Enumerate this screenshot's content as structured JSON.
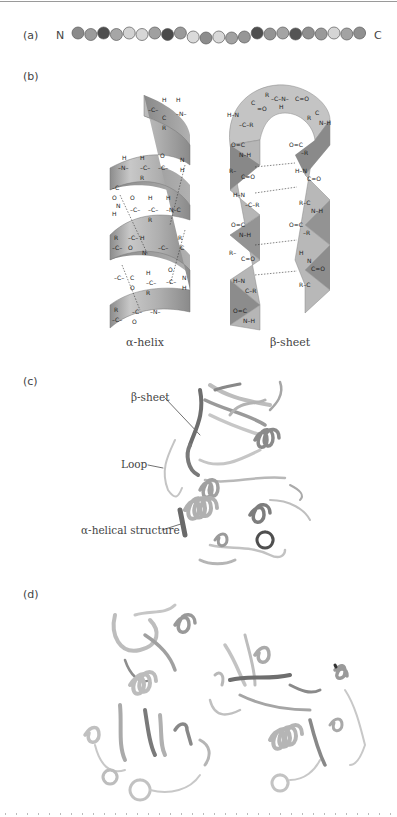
{
  "figure": {
    "panels": [
      {
        "id": "a",
        "label": "(a)",
        "title": "Primary structure",
        "n_terminus": "N",
        "c_terminus": "C",
        "residues": [
          {
            "shade": "#8a8a8a"
          },
          {
            "shade": "#9c9c9c"
          },
          {
            "shade": "#4d4d4d"
          },
          {
            "shade": "#a6a6a6"
          },
          {
            "shade": "#d2d2d2"
          },
          {
            "shade": "#d6d6d6"
          },
          {
            "shade": "#a0a0a0"
          },
          {
            "shade": "#4a4a4a"
          },
          {
            "shade": "#9a9a9a"
          },
          {
            "shade": "#dadada"
          },
          {
            "shade": "#8c8c8c"
          },
          {
            "shade": "#d8d8d8"
          },
          {
            "shade": "#a2a2a2"
          },
          {
            "shade": "#979797"
          },
          {
            "shade": "#4e4e4e"
          },
          {
            "shade": "#949494"
          },
          {
            "shade": "#a4a4a4"
          },
          {
            "shade": "#545454"
          },
          {
            "shade": "#8f8f8f"
          },
          {
            "shade": "#999999"
          },
          {
            "shade": "#d5d5d5"
          },
          {
            "shade": "#a3a3a3"
          },
          {
            "shade": "#909090"
          }
        ]
      },
      {
        "id": "b",
        "label": "(b)",
        "title": "Secondary structure",
        "structures": [
          {
            "name": "alpha-helix",
            "caption": "α-helix",
            "atoms": [
              "H",
              "C",
              "N",
              "O",
              "R"
            ]
          },
          {
            "name": "beta-sheet",
            "caption": "β-sheet",
            "atoms": [
              "H",
              "C",
              "N",
              "O",
              "R"
            ]
          }
        ]
      },
      {
        "id": "c",
        "label": "(c)",
        "title": "Tertiary structure",
        "annotations": [
          {
            "text": "β-sheet"
          },
          {
            "text": "Loop"
          },
          {
            "text": "α-helical structure"
          }
        ]
      },
      {
        "id": "d",
        "label": "(d)",
        "title": "Quaternary structure",
        "subunits": 2
      }
    ]
  },
  "colors": {
    "ribbon_light": "#d9d9d9",
    "ribbon_mid": "#b5b5b5",
    "ribbon_dark": "#7a7a7a",
    "text": "#444444",
    "rule": "#9a9a9a"
  }
}
